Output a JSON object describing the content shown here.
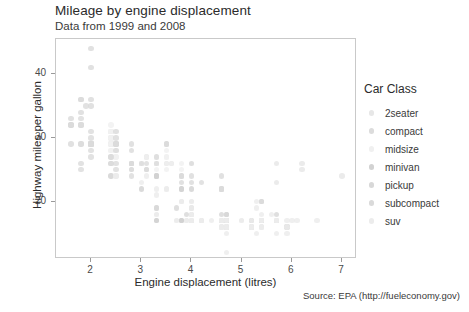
{
  "titles": {
    "title": "Mileage by engine displacement",
    "subtitle": "Data from 1999 and 2008",
    "caption": "Source: EPA (http://fueleconomy.gov)"
  },
  "axes": {
    "x_label": "Engine displacement (litres)",
    "y_label": "Highway miles per gallon",
    "x_ticks": [
      "2",
      "3",
      "4",
      "5",
      "6",
      "7"
    ],
    "y_ticks": [
      "20",
      "30",
      "40"
    ]
  },
  "legend": {
    "title": "Car Class",
    "items": [
      {
        "label": "2seater",
        "color": "#e7e7e7"
      },
      {
        "label": "compact",
        "color": "#dcdcdc"
      },
      {
        "label": "midsize",
        "color": "#f0f0f0"
      },
      {
        "label": "minivan",
        "color": "#d2d2d2"
      },
      {
        "label": "pickup",
        "color": "#d8d8d8"
      },
      {
        "label": "subcompact",
        "color": "#dadada"
      },
      {
        "label": "suv",
        "color": "#ececec"
      }
    ]
  },
  "chart_data": {
    "type": "scatter",
    "title": "Mileage by engine displacement",
    "subtitle": "Data from 1999 and 2008",
    "caption": "Source: EPA (http://fueleconomy.gov)",
    "xlabel": "Engine displacement (litres)",
    "ylabel": "Highway miles per gallon",
    "xlim": [
      1.3,
      7.3
    ],
    "ylim": [
      11.0,
      45.5
    ],
    "xticks": [
      2,
      3,
      4,
      5,
      6,
      7
    ],
    "yticks": [
      20,
      30,
      40
    ],
    "grid": false,
    "legend_title": "Car Class",
    "legend_position": "right",
    "color_by": "class",
    "point_alpha": 0.45,
    "point_size": 5.5,
    "series": [
      {
        "name": "2seater",
        "color": "#e7e7e7",
        "points": [
          [
            5.7,
            26
          ],
          [
            5.7,
            23
          ],
          [
            6.2,
            26
          ],
          [
            6.2,
            25
          ],
          [
            7.0,
            24
          ]
        ]
      },
      {
        "name": "compact",
        "color": "#dcdcdc",
        "points": [
          [
            1.8,
            29
          ],
          [
            1.8,
            29
          ],
          [
            2.0,
            31
          ],
          [
            2.0,
            30
          ],
          [
            2.8,
            26
          ],
          [
            2.8,
            26
          ],
          [
            3.1,
            27
          ],
          [
            1.8,
            26
          ],
          [
            1.8,
            25
          ],
          [
            2.0,
            28
          ],
          [
            2.0,
            27
          ],
          [
            2.8,
            25
          ],
          [
            2.8,
            25
          ],
          [
            3.1,
            25
          ],
          [
            3.1,
            25
          ],
          [
            2.8,
            24
          ],
          [
            3.1,
            25
          ],
          [
            4.2,
            23
          ],
          [
            2.4,
            29
          ],
          [
            2.4,
            29
          ],
          [
            3.1,
            26
          ],
          [
            3.5,
            26
          ],
          [
            2.4,
            31
          ],
          [
            2.4,
            30
          ],
          [
            3.3,
            26
          ],
          [
            1.8,
            33
          ],
          [
            1.8,
            32
          ],
          [
            2.0,
            29
          ],
          [
            2.0,
            29
          ],
          [
            2.0,
            29
          ],
          [
            2.0,
            29
          ],
          [
            2.8,
            26
          ],
          [
            1.9,
            35
          ],
          [
            2.0,
            29
          ],
          [
            2.0,
            29
          ],
          [
            2.5,
            29
          ],
          [
            2.5,
            29
          ],
          [
            1.8,
            32
          ],
          [
            1.8,
            32
          ],
          [
            2.0,
            29
          ],
          [
            2.0,
            29
          ],
          [
            2.8,
            26
          ],
          [
            2.8,
            26
          ],
          [
            3.6,
            26
          ],
          [
            2.4,
            27
          ],
          [
            2.4,
            26
          ],
          [
            2.5,
            26
          ],
          [
            2.5,
            25
          ]
        ]
      },
      {
        "name": "midsize",
        "color": "#f0f0f0",
        "points": [
          [
            2.4,
            31
          ],
          [
            3.0,
            26
          ],
          [
            3.3,
            27
          ],
          [
            2.4,
            30
          ],
          [
            3.0,
            26
          ],
          [
            3.3,
            26
          ],
          [
            2.4,
            29
          ],
          [
            3.0,
            26
          ],
          [
            3.3,
            26
          ],
          [
            2.4,
            28
          ],
          [
            2.4,
            31
          ],
          [
            2.5,
            29
          ],
          [
            2.5,
            27
          ],
          [
            3.3,
            26
          ],
          [
            3.5,
            28
          ],
          [
            3.6,
            26
          ],
          [
            2.4,
            30
          ],
          [
            3.0,
            26
          ],
          [
            3.5,
            29
          ],
          [
            3.5,
            27
          ],
          [
            2.4,
            32
          ],
          [
            2.4,
            29
          ],
          [
            3.1,
            27
          ],
          [
            3.8,
            26
          ],
          [
            3.8,
            25
          ],
          [
            4.0,
            26
          ],
          [
            2.5,
            27
          ],
          [
            2.5,
            28
          ],
          [
            3.5,
            25
          ],
          [
            3.8,
            24
          ],
          [
            2.4,
            31
          ],
          [
            2.4,
            28
          ],
          [
            3.0,
            26
          ],
          [
            3.3,
            26
          ],
          [
            3.5,
            26
          ],
          [
            3.5,
            27
          ],
          [
            2.4,
            29
          ],
          [
            2.4,
            30
          ],
          [
            3.0,
            26
          ],
          [
            3.3,
            25
          ]
        ]
      },
      {
        "name": "minivan",
        "color": "#d2d2d2",
        "points": [
          [
            2.4,
            24
          ],
          [
            3.0,
            22
          ],
          [
            3.3,
            24
          ],
          [
            3.3,
            24
          ],
          [
            3.8,
            22
          ],
          [
            3.8,
            22
          ],
          [
            4.0,
            22
          ],
          [
            3.3,
            24
          ],
          [
            3.3,
            17
          ],
          [
            3.8,
            17
          ],
          [
            3.3,
            17
          ],
          [
            3.8,
            17
          ],
          [
            3.8,
            17
          ]
        ]
      },
      {
        "name": "pickup",
        "color": "#d8d8d8",
        "points": [
          [
            4.7,
            18
          ],
          [
            5.7,
            18
          ],
          [
            5.7,
            17
          ],
          [
            4.7,
            17
          ],
          [
            4.7,
            17
          ],
          [
            5.2,
            17
          ],
          [
            5.7,
            17
          ],
          [
            5.9,
            16
          ],
          [
            4.7,
            17
          ],
          [
            4.7,
            17
          ],
          [
            5.2,
            16
          ],
          [
            3.7,
            19
          ],
          [
            3.9,
            18
          ],
          [
            4.7,
            18
          ],
          [
            4.7,
            18
          ],
          [
            5.2,
            17
          ],
          [
            5.9,
            16
          ],
          [
            4.2,
            17
          ],
          [
            4.6,
            17
          ],
          [
            5.4,
            17
          ],
          [
            5.4,
            17
          ],
          [
            3.3,
            19
          ],
          [
            3.3,
            19
          ],
          [
            4.0,
            19
          ],
          [
            4.0,
            18
          ],
          [
            4.6,
            18
          ],
          [
            4.6,
            17
          ],
          [
            4.6,
            17
          ],
          [
            5.4,
            17
          ],
          [
            5.4,
            17
          ],
          [
            4.7,
            17
          ],
          [
            4.7,
            16
          ],
          [
            5.2,
            16
          ],
          [
            4.7,
            16
          ]
        ]
      },
      {
        "name": "subcompact",
        "color": "#dadada",
        "points": [
          [
            2.0,
            29
          ],
          [
            2.0,
            29
          ],
          [
            2.5,
            29
          ],
          [
            2.5,
            28
          ],
          [
            2.8,
            26
          ],
          [
            2.8,
            26
          ],
          [
            3.0,
            26
          ],
          [
            3.3,
            26
          ],
          [
            1.6,
            32
          ],
          [
            1.6,
            33
          ],
          [
            1.6,
            32
          ],
          [
            1.6,
            29
          ],
          [
            1.6,
            32
          ],
          [
            1.8,
            34
          ],
          [
            1.8,
            36
          ],
          [
            1.8,
            36
          ],
          [
            2.0,
            29
          ],
          [
            2.4,
            26
          ],
          [
            2.4,
            27
          ],
          [
            2.5,
            30
          ],
          [
            2.5,
            31
          ],
          [
            3.3,
            27
          ],
          [
            2.0,
            44
          ],
          [
            2.0,
            41
          ],
          [
            2.0,
            36
          ],
          [
            2.0,
            35
          ],
          [
            2.5,
            29
          ],
          [
            2.5,
            29
          ],
          [
            2.8,
            28
          ],
          [
            2.8,
            29
          ],
          [
            3.5,
            29
          ],
          [
            3.5,
            29
          ],
          [
            3.8,
            24
          ],
          [
            3.8,
            24
          ],
          [
            4.0,
            26
          ],
          [
            4.0,
            24
          ],
          [
            4.6,
            22
          ],
          [
            4.6,
            22
          ],
          [
            4.6,
            24
          ],
          [
            5.4,
            20
          ],
          [
            5.4,
            20
          ],
          [
            3.8,
            23
          ],
          [
            4.0,
            23
          ],
          [
            4.6,
            22
          ],
          [
            4.6,
            22
          ],
          [
            5.4,
            20
          ]
        ]
      },
      {
        "name": "suv",
        "color": "#ececec",
        "points": [
          [
            4.0,
            17
          ],
          [
            4.0,
            17
          ],
          [
            4.6,
            17
          ],
          [
            4.6,
            16
          ],
          [
            4.6,
            17
          ],
          [
            4.6,
            17
          ],
          [
            4.6,
            17
          ],
          [
            5.4,
            17
          ],
          [
            3.3,
            18
          ],
          [
            3.3,
            18
          ],
          [
            4.0,
            17
          ],
          [
            4.0,
            17
          ],
          [
            4.0,
            17
          ],
          [
            4.6,
            17
          ],
          [
            4.7,
            16
          ],
          [
            5.7,
            17
          ],
          [
            6.1,
            17
          ],
          [
            4.0,
            18
          ],
          [
            4.2,
            17
          ],
          [
            4.4,
            17
          ],
          [
            4.6,
            17
          ],
          [
            5.4,
            16
          ],
          [
            5.4,
            17
          ],
          [
            4.0,
            17
          ],
          [
            4.0,
            17
          ],
          [
            4.6,
            17
          ],
          [
            5.0,
            17
          ],
          [
            4.2,
            17
          ],
          [
            4.2,
            17
          ],
          [
            4.6,
            17
          ],
          [
            4.6,
            17
          ],
          [
            4.7,
            16
          ],
          [
            4.7,
            15
          ],
          [
            4.7,
            16
          ],
          [
            5.2,
            16
          ],
          [
            5.7,
            17
          ],
          [
            5.9,
            15
          ],
          [
            4.6,
            16
          ],
          [
            5.4,
            16
          ],
          [
            5.4,
            16
          ],
          [
            4.0,
            19
          ],
          [
            4.0,
            18
          ],
          [
            4.6,
            17
          ],
          [
            5.0,
            17
          ],
          [
            4.0,
            20
          ],
          [
            4.7,
            12
          ],
          [
            4.7,
            16
          ],
          [
            5.7,
            17
          ],
          [
            6.5,
            17
          ],
          [
            2.5,
            24
          ],
          [
            2.5,
            24
          ],
          [
            3.5,
            22
          ],
          [
            3.5,
            22
          ],
          [
            3.0,
            23
          ],
          [
            3.3,
            21
          ],
          [
            3.3,
            22
          ],
          [
            4.0,
            20
          ],
          [
            5.6,
            18
          ],
          [
            3.1,
            24
          ],
          [
            3.8,
            20
          ],
          [
            3.8,
            20
          ],
          [
            3.8,
            20
          ],
          [
            5.3,
            20
          ],
          [
            5.3,
            15
          ],
          [
            5.3,
            19
          ],
          [
            5.7,
            15
          ],
          [
            6.0,
            17
          ],
          [
            5.9,
            17
          ],
          [
            4.6,
            16
          ],
          [
            4.6,
            16
          ],
          [
            4.6,
            17
          ],
          [
            5.4,
            17
          ],
          [
            5.4,
            18
          ],
          [
            4.0,
            17
          ],
          [
            4.0,
            18
          ],
          [
            4.6,
            17
          ],
          [
            4.6,
            17
          ],
          [
            5.4,
            17
          ],
          [
            3.7,
            17
          ],
          [
            3.7,
            17
          ],
          [
            3.9,
            17
          ],
          [
            3.9,
            17
          ],
          [
            4.7,
            17
          ],
          [
            4.7,
            17
          ],
          [
            4.7,
            17
          ],
          [
            5.2,
            16
          ],
          [
            5.2,
            16
          ],
          [
            3.9,
            17
          ],
          [
            4.7,
            17
          ],
          [
            4.7,
            17
          ],
          [
            4.7,
            17
          ],
          [
            5.2,
            17
          ],
          [
            5.7,
            17
          ],
          [
            5.9,
            16
          ]
        ]
      }
    ]
  }
}
